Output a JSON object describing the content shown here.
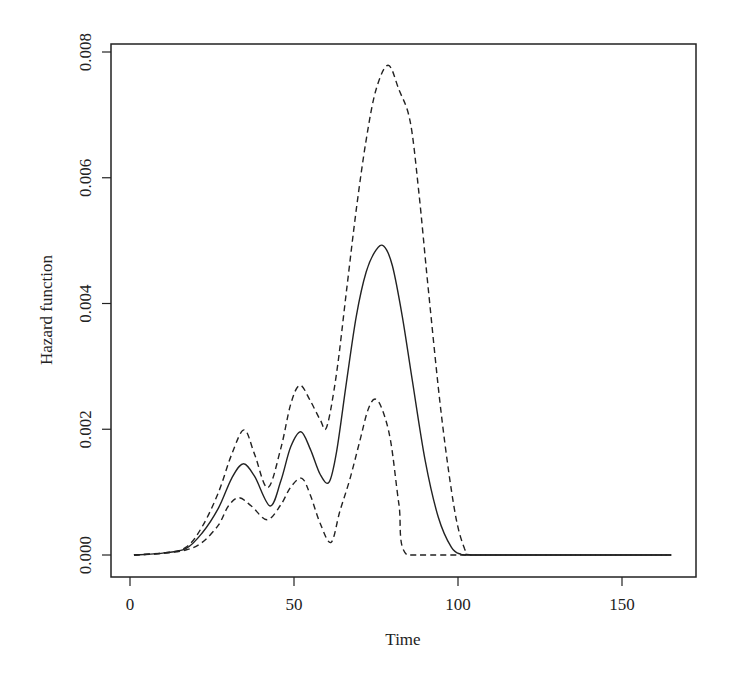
{
  "chart_data": {
    "type": "line",
    "title": "",
    "xlabel": "Time",
    "ylabel": "Hazard function",
    "xlim": [
      0,
      172
    ],
    "ylim": [
      0,
      0.008
    ],
    "x_ticks": [
      0,
      50,
      100,
      150
    ],
    "x_tick_labels": [
      "0",
      "50",
      "100",
      "150"
    ],
    "y_ticks": [
      0.0,
      0.002,
      0.004,
      0.006,
      0.008
    ],
    "y_tick_labels": [
      "0.000",
      "0.002",
      "0.004",
      "0.006",
      "0.008"
    ],
    "grid": false,
    "legend": null,
    "series": [
      {
        "name": "Hazard estimate",
        "style": "solid",
        "x": [
          1.2,
          10,
          17,
          22,
          27,
          31,
          34.5,
          38,
          42.7,
          46,
          49,
          52.1,
          55,
          58,
          60.7,
          63,
          66,
          69,
          72,
          75,
          77.4,
          80,
          83,
          86,
          90,
          94,
          98,
          101,
          104,
          120,
          140,
          165
        ],
        "y": [
          0,
          3e-05,
          0.0001,
          0.00035,
          0.00075,
          0.00122,
          0.00145,
          0.00125,
          0.00078,
          0.00118,
          0.00172,
          0.00196,
          0.00168,
          0.00128,
          0.00116,
          0.00165,
          0.00275,
          0.0038,
          0.0045,
          0.00485,
          0.00491,
          0.0046,
          0.0038,
          0.0028,
          0.0015,
          0.0006,
          0.00012,
          1e-05,
          0,
          0,
          0,
          0
        ]
      },
      {
        "name": "Upper confidence bound",
        "style": "dashed",
        "x": [
          1.2,
          10,
          17,
          22,
          27,
          31,
          34.8,
          38,
          42,
          46,
          49,
          51.8,
          55,
          58,
          60,
          63,
          66,
          69,
          72,
          75,
          78.7,
          82,
          85.4,
          88,
          91,
          95,
          99,
          102,
          104,
          120,
          140,
          165
        ],
        "y": [
          0,
          3e-05,
          0.00012,
          0.00045,
          0.001,
          0.0016,
          0.00199,
          0.0016,
          0.00107,
          0.0017,
          0.0024,
          0.0027,
          0.00245,
          0.00215,
          0.00204,
          0.0029,
          0.0042,
          0.0055,
          0.0066,
          0.0074,
          0.00779,
          0.0074,
          0.0069,
          0.0058,
          0.0042,
          0.0022,
          0.0007,
          0.0001,
          0,
          0,
          0,
          0
        ]
      },
      {
        "name": "Lower confidence bound",
        "style": "dashed",
        "x": [
          1.2,
          10,
          17,
          22,
          27,
          30,
          33.2,
          37,
          41.8,
          46,
          49,
          52.4,
          55,
          58,
          61.3,
          64,
          67,
          70,
          72.5,
          74.7,
          77,
          79.5,
          82,
          84.5,
          100,
          120,
          140,
          165
        ],
        "y": [
          0,
          3e-05,
          8e-05,
          0.0002,
          0.00048,
          0.00078,
          0.00091,
          0.00078,
          0.00056,
          0.0008,
          0.00108,
          0.00122,
          0.00095,
          0.0005,
          0.0002,
          0.0007,
          0.0012,
          0.0018,
          0.0023,
          0.00248,
          0.0023,
          0.0018,
          0.0008,
          0,
          0,
          0,
          0,
          0
        ]
      }
    ]
  },
  "layout": {
    "plot_left": 111,
    "plot_right": 696,
    "plot_top": 44,
    "plot_bottom": 577,
    "x0_px": 130,
    "x_px_per_unit": 3.28,
    "y0_px": 555,
    "y_px_per_unit": 62875,
    "line_color": "#222222"
  }
}
